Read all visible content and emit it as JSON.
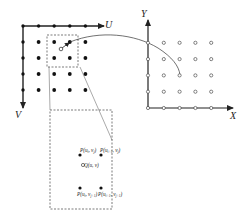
{
  "diagram": {
    "colors": {
      "stroke": "#222222",
      "dash": "#555555",
      "background": "#ffffff"
    },
    "source_grid": {
      "axis_u_label": "U",
      "axis_v_label": "V",
      "columns": 5,
      "rows": 5,
      "point_style": "filled"
    },
    "target_grid": {
      "axis_x_label": "X",
      "axis_y_label": "Y",
      "columns": 5,
      "rows": 5,
      "point_style": "open"
    },
    "inset": {
      "top_left_label": "P(u_i, v_j)",
      "top_right_label": "P(u_{i+1}, v_j)",
      "bottom_left_label": "P(u_i, v_{j+1})",
      "bottom_right_label": "P(u_{i+1}, v_{j+1})",
      "center_label": "Q(u, v)",
      "tl": {
        "p": "P(",
        "a": "u",
        "as": "i",
        "sep": ", ",
        "b": "v",
        "bs": "j",
        "c": ")"
      },
      "tr": {
        "p": "P(",
        "a": "u",
        "as": "i+1",
        "sep": ", ",
        "b": "v",
        "bs": "j",
        "c": ")"
      },
      "bl": {
        "p": "P(",
        "a": "u",
        "as": "i",
        "sep": ", ",
        "b": "v",
        "bs": "j+1",
        "c": ")"
      },
      "br": {
        "p": "P(",
        "a": "u",
        "as": "i+1",
        "sep": ", ",
        "b": "v",
        "bs": "j+1",
        "c": ")"
      },
      "q": {
        "p": "Q(",
        "a": "u",
        "sep": ", ",
        "b": "v",
        "c": ")"
      }
    }
  }
}
